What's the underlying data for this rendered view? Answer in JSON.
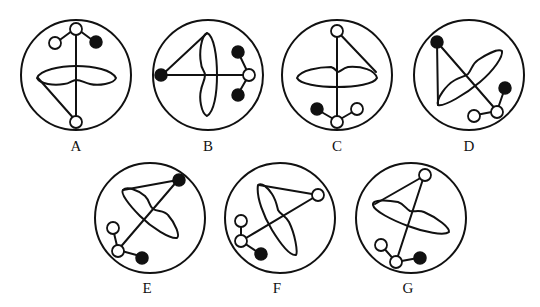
{
  "figure": {
    "type": "multiple-choice molecular/figure diagram",
    "options": [
      {
        "label": "A",
        "cx": 76,
        "cy": 75
      },
      {
        "label": "B",
        "cx": 208,
        "cy": 75
      },
      {
        "label": "C",
        "cx": 337,
        "cy": 75
      },
      {
        "label": "D",
        "cx": 469,
        "cy": 75
      },
      {
        "label": "E",
        "cx": 150,
        "cy": 218
      },
      {
        "label": "F",
        "cx": 280,
        "cy": 218
      },
      {
        "label": "G",
        "cx": 411,
        "cy": 218
      }
    ]
  },
  "labels": {
    "A": "A",
    "B": "B",
    "C": "C",
    "D": "D",
    "E": "E",
    "F": "F",
    "G": "G"
  },
  "colors": {
    "ink": "#111111",
    "background": "#ffffff"
  }
}
